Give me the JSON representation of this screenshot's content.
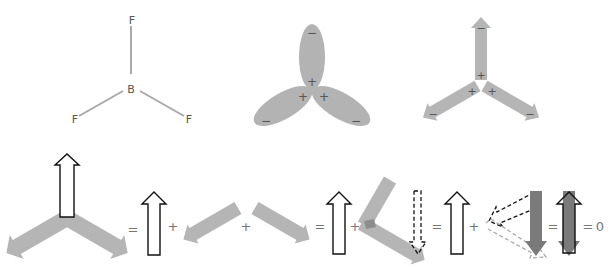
{
  "colors": {
    "bond": "#a8a8a8",
    "lobe": "#b3b3b3",
    "arrow_gray": "#b5b5b5",
    "arrow_dark": "#7a7a7a",
    "outline": "#111111",
    "dashed_light": "#aaaaaa",
    "text": "#555555"
  },
  "molecule": {
    "center_atom": "B",
    "ligands": [
      "F",
      "F",
      "F"
    ]
  },
  "orbitals": {
    "lobe_outer_sign": "−",
    "lobe_inner_sign": "+"
  },
  "dipoles": {
    "tail_sign": "+",
    "head_sign": "−"
  },
  "equation": {
    "eq1": "=",
    "plus1": "+",
    "plus2": "+",
    "eq2": "=",
    "plus3": "+",
    "eq3": "=",
    "plus4": "+",
    "eq4": "=",
    "eq5": "=",
    "result": "0"
  }
}
